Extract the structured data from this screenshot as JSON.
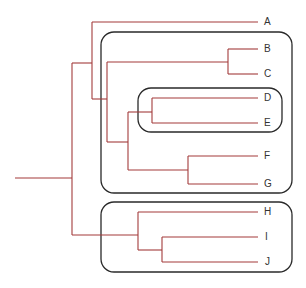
{
  "diagram": {
    "type": "phylogenetic-tree",
    "colors": {
      "branch": "#a33b3b",
      "box": "#2a2a2a",
      "label": "#333333"
    },
    "taxa": [
      {
        "label": "A",
        "y": 22
      },
      {
        "label": "B",
        "y": 49
      },
      {
        "label": "C",
        "y": 74
      },
      {
        "label": "D",
        "y": 98
      },
      {
        "label": "E",
        "y": 123
      },
      {
        "label": "F",
        "y": 156
      },
      {
        "label": "G",
        "y": 184
      },
      {
        "label": "H",
        "y": 212
      },
      {
        "label": "I",
        "y": 237
      },
      {
        "label": "J",
        "y": 262
      }
    ],
    "clade_boxes": [
      {
        "name": "B-G",
        "members": [
          "B",
          "C",
          "D",
          "E",
          "F",
          "G"
        ]
      },
      {
        "name": "D-E",
        "members": [
          "D",
          "E"
        ]
      },
      {
        "name": "H-J",
        "members": [
          "H",
          "I",
          "J"
        ]
      }
    ],
    "newick": "(((A,((B,C),((D,E),(F,G)))),(H,(I,J))));"
  }
}
